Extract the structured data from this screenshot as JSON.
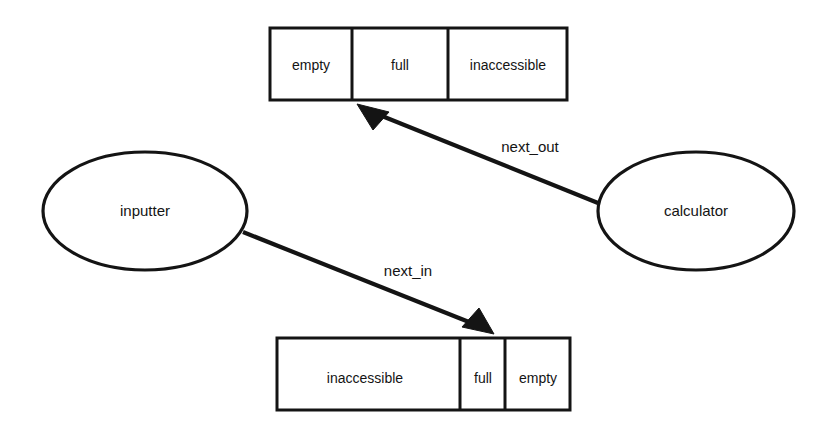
{
  "diagram": {
    "background_color": "#ffffff",
    "line_color": "#141414",
    "hatch_color": "#d2d2d2",
    "buffers": [
      {
        "id": "output-buffer",
        "position": "top",
        "x": 270,
        "y": 28,
        "width": 297,
        "height": 72,
        "cells": [
          {
            "label": "empty",
            "state": "empty",
            "x": 270,
            "width": 82,
            "fill": "plain"
          },
          {
            "label": "full",
            "state": "full",
            "x": 352,
            "width": 96,
            "fill": "hatched"
          },
          {
            "label": "inaccessible",
            "state": "inaccessible",
            "x": 448,
            "width": 119,
            "fill": "plain"
          }
        ]
      },
      {
        "id": "input-buffer",
        "position": "bottom",
        "x": 277,
        "y": 338,
        "width": 293,
        "height": 72,
        "cells": [
          {
            "label": "inaccessible",
            "state": "inaccessible",
            "x": 277,
            "width": 183,
            "fill": "plain"
          },
          {
            "label": "full",
            "state": "full",
            "x": 460,
            "width": 45,
            "fill": "hatched"
          },
          {
            "label": "empty",
            "state": "empty",
            "x": 505,
            "width": 65,
            "fill": "plain"
          }
        ]
      }
    ],
    "nodes": [
      {
        "id": "inputter",
        "label": "inputter",
        "shape": "ellipse",
        "cx": 145,
        "cy": 211,
        "rx": 102,
        "ry": 59
      },
      {
        "id": "calculator",
        "label": "calculator",
        "shape": "ellipse",
        "cx": 696,
        "cy": 211,
        "rx": 98,
        "ry": 59
      }
    ],
    "edges": [
      {
        "id": "next-out",
        "label": "next_out",
        "from": "calculator",
        "to": "output-buffer",
        "x1": 598,
        "y1": 203,
        "x2": 358,
        "y2": 105,
        "label_x": 530,
        "label_y": 148,
        "arrow_direction": "up-left"
      },
      {
        "id": "next-in",
        "label": "next_in",
        "from": "inputter",
        "to": "input-buffer",
        "x1": 243,
        "y1": 232,
        "x2": 493,
        "y2": 333,
        "label_x": 408,
        "label_y": 272,
        "arrow_direction": "down-right"
      }
    ]
  }
}
